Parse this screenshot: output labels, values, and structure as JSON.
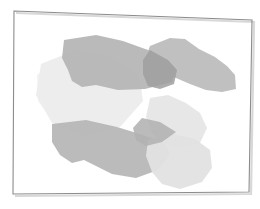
{
  "meta": {
    "kind": "abstract-shape-composition",
    "width": 260,
    "height": 209,
    "background_color": "#ffffff",
    "caption": ""
  },
  "frame": {
    "name": "page-border",
    "description": "thin slightly-rotated quadrilateral outline with soft drop shadow on right and bottom",
    "stroke_color": "#8c8c8c",
    "stroke_width": 1.1,
    "shadow_color": "#d8d8d8",
    "shadow_width": 2.2,
    "shadow_offset_x": 2,
    "shadow_offset_y": 2,
    "points": "14,11 252,20 249,192 13,194"
  },
  "shapes": [
    {
      "id": "pale-left-lobe",
      "name": "shape-pale-left-lobe",
      "fill": "#f2f2f2",
      "opacity": 1,
      "points": "60,57 104,60 128,84 133,104 120,124 92,134 57,126 38,101 37,75"
    },
    {
      "id": "pale-wide-sheet",
      "name": "shape-pale-wide-sheet",
      "fill": "#ededed",
      "opacity": 1,
      "points": "41,64 78,49 112,58 139,74 143,101 120,127 82,136 52,123 36,95"
    },
    {
      "id": "mid-upper-band",
      "name": "shape-mid-upper-band",
      "fill": "#b4b4b4",
      "opacity": 0.92,
      "points": "64,40 96,35 123,41 148,50 166,60 176,68 172,82 145,89 118,90 96,85 82,87 72,81 68,70 62,58"
    },
    {
      "id": "mid-upper-right-wing",
      "name": "shape-mid-upper-right-wing",
      "fill": "#b9b9b9",
      "opacity": 0.9,
      "points": "150,46 170,38 185,39 199,49 215,57 227,66 235,75 236,89 222,92 206,90 190,84 176,78 161,74 151,66 146,56"
    },
    {
      "id": "dark-overlap-wedge",
      "name": "shape-dark-overlap-wedge",
      "fill": "#9f9f9f",
      "opacity": 0.85,
      "points": "150,50 168,60 177,70 174,84 160,89 148,86 143,74 143,60"
    },
    {
      "id": "mid-lower-left-slab",
      "name": "shape-mid-lower-left-slab",
      "fill": "#b6b6b6",
      "opacity": 0.93,
      "points": "52,124 86,120 117,127 143,135 164,143 170,154 158,170 136,178 112,174 96,166 84,160 72,163 60,155 52,142"
    },
    {
      "id": "pale-mid-right-panel",
      "name": "shape-pale-mid-right-panel",
      "fill": "#e6e6e6",
      "opacity": 0.95,
      "points": "150,98 168,95 186,103 200,113 207,128 200,143 182,148 164,144 152,133 146,117"
    },
    {
      "id": "pale-lower-right-panel",
      "name": "shape-pale-lower-right-panel",
      "fill": "#e2e2e2",
      "opacity": 0.95,
      "points": "148,140 172,134 195,139 210,150 212,168 202,182 180,189 162,184 152,172 146,156"
    },
    {
      "id": "mid-crossing-arrow",
      "name": "shape-mid-crossing-arrow",
      "fill": "#b2b2b2",
      "opacity": 0.88,
      "points": "142,118 160,122 176,132 162,142 146,146 136,140 133,128"
    }
  ],
  "palette": {
    "background": "#ffffff",
    "frame_stroke": "#8c8c8c",
    "lightest_gray": "#f2f2f2",
    "light_gray": "#e4e4e4",
    "mid_gray": "#b4b4b4",
    "dark_gray": "#9f9f9f"
  }
}
